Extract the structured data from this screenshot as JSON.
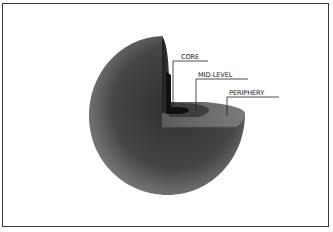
{
  "diagram": {
    "title": "",
    "type": "cutaway-sphere",
    "labels": [
      {
        "id": "core",
        "text": "CORE"
      },
      {
        "id": "mid-level",
        "text": "MID-LEVEL"
      },
      {
        "id": "periphery",
        "text": "PERIPHERY"
      }
    ],
    "colors": {
      "sphere_light": "#8a8a8a",
      "sphere_dark": "#2e2e2e",
      "periphery_fill": "#6e6e6e",
      "midlevel_fill": "#3c3c3c",
      "core_fill": "#121212",
      "border": "#3a3a3a",
      "leader_line": "#222222"
    }
  }
}
